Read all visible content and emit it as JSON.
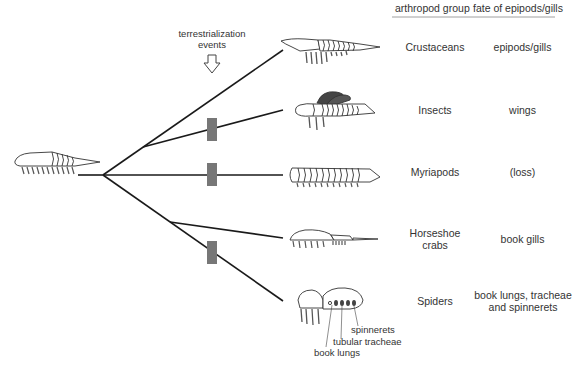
{
  "header": {
    "col1": "arthropod group",
    "col2": "fate of epipods/gills"
  },
  "annotation": {
    "line1": "terrestrialization",
    "line2": "events",
    "arrow_icon": "down-arrow-outline"
  },
  "rows": [
    {
      "group": "Crustaceans",
      "fate": "epipods/gills",
      "terrestrial": false
    },
    {
      "group": "Insects",
      "fate": "wings",
      "terrestrial": true
    },
    {
      "group": "Myriapods",
      "fate": "(loss)",
      "terrestrial": true
    },
    {
      "group_line1": "Horseshoe",
      "group_line2": "crabs",
      "fate": "book gills",
      "terrestrial": false
    },
    {
      "group": "Spiders",
      "fate_line1": "book lungs, tracheae",
      "fate_line2": "and spinnerets",
      "terrestrial": true
    }
  ],
  "spider_labels": {
    "spinnerets": "spinnerets",
    "tracheae": "tubular tracheae",
    "book_lungs": "book lungs"
  },
  "colors": {
    "line": "#1a1a1a",
    "marker": "#777777",
    "wing": "#444444",
    "text": "#333333"
  }
}
